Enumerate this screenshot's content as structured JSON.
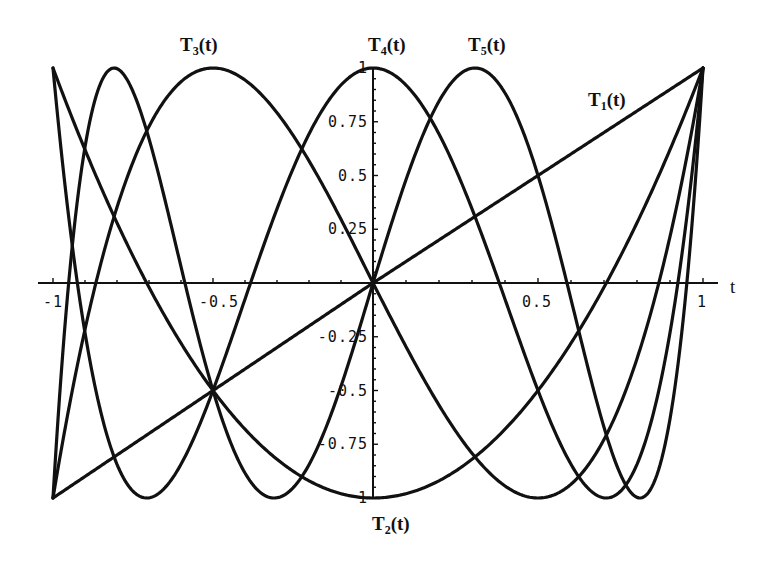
{
  "chart_data": {
    "type": "line",
    "title": "",
    "xlabel": "t",
    "ylabel": "",
    "xlim": [
      -1,
      1
    ],
    "ylim": [
      -1,
      1
    ],
    "grid": false,
    "legend": "inline curve labels",
    "x_ticks": [
      {
        "value": -1,
        "label": "-1"
      },
      {
        "value": -0.5,
        "label": "-0.5"
      },
      {
        "value": 0.5,
        "label": "0.5"
      },
      {
        "value": 1,
        "label": "1"
      }
    ],
    "y_ticks": [
      {
        "value": 1,
        "label": "1"
      },
      {
        "value": 0.75,
        "label": "0.75"
      },
      {
        "value": 0.5,
        "label": "0.5"
      },
      {
        "value": 0.25,
        "label": "0.25"
      },
      {
        "value": -0.25,
        "label": "-0.25"
      },
      {
        "value": -0.5,
        "label": "-0.5"
      },
      {
        "value": -0.75,
        "label": "-0.75"
      },
      {
        "value": -1,
        "label": "1"
      }
    ],
    "x": [
      -1,
      -0.9,
      -0.8,
      -0.7,
      -0.6,
      -0.5,
      -0.4,
      -0.3,
      -0.2,
      -0.1,
      0,
      0.1,
      0.2,
      0.3,
      0.4,
      0.5,
      0.6,
      0.7,
      0.8,
      0.9,
      1
    ],
    "series": [
      {
        "name": "T1(t)",
        "label_base": "T",
        "label_sub": "1",
        "label_tail": "(t)",
        "label_pos": [
          588,
          106
        ],
        "order": 1,
        "values": [
          -1,
          -0.9,
          -0.8,
          -0.7,
          -0.6,
          -0.5,
          -0.4,
          -0.3,
          -0.2,
          -0.1,
          0,
          0.1,
          0.2,
          0.3,
          0.4,
          0.5,
          0.6,
          0.7,
          0.8,
          0.9,
          1
        ]
      },
      {
        "name": "T2(t)",
        "label_base": "T",
        "label_sub": "2",
        "label_tail": "(t)",
        "label_pos": [
          372,
          530
        ],
        "order": 2,
        "values": [
          1,
          0.62,
          0.28,
          -0.02,
          -0.28,
          -0.5,
          -0.68,
          -0.82,
          -0.92,
          -0.98,
          -1,
          -0.98,
          -0.92,
          -0.82,
          -0.68,
          -0.5,
          -0.28,
          -0.02,
          0.28,
          0.62,
          1
        ]
      },
      {
        "name": "T3(t)",
        "label_base": "T",
        "label_sub": "3",
        "label_tail": "(t)",
        "label_pos": [
          180,
          51
        ],
        "order": 3,
        "values": [
          -1,
          -0.216,
          0.352,
          0.728,
          0.936,
          1,
          0.944,
          0.792,
          0.568,
          0.296,
          0,
          -0.296,
          -0.568,
          -0.792,
          -0.944,
          -1,
          -0.936,
          -0.728,
          -0.352,
          0.216,
          1
        ]
      },
      {
        "name": "T4(t)",
        "label_base": "T",
        "label_sub": "4",
        "label_tail": "(t)",
        "label_pos": [
          368,
          51
        ],
        "order": 4,
        "values": [
          1,
          -0.2312,
          -0.8432,
          -0.9992,
          -0.8432,
          -0.5,
          -0.0752,
          0.3448,
          0.6928,
          0.9208,
          1,
          0.9208,
          0.6928,
          0.3448,
          -0.0752,
          -0.5,
          -0.8432,
          -0.9992,
          -0.8432,
          -0.2312,
          1
        ]
      },
      {
        "name": "T5(t)",
        "label_base": "T",
        "label_sub": "5",
        "label_tail": "(t)",
        "label_pos": [
          468,
          51
        ],
        "order": 5,
        "values": [
          -1,
          0.9987,
          0.4,
          -0.6971,
          -0.9984,
          -0.5,
          0.3848,
          0.9988,
          0.7651,
          -0.4,
          0,
          0.4,
          -0.7651,
          -0.9988,
          -0.3848,
          0.5,
          0.9984,
          0.6971,
          -0.4,
          -0.9987,
          1
        ]
      }
    ],
    "annotations": [
      "T1(t)",
      "T2(t)",
      "T3(t)",
      "T4(t)",
      "T5(t)"
    ]
  },
  "plot_frame": {
    "x_left_px": 53,
    "x_zero_px": 373,
    "x_right_px": 703,
    "y_top_px": 68,
    "y_zero_px": 283,
    "y_bottom_px": 498
  }
}
